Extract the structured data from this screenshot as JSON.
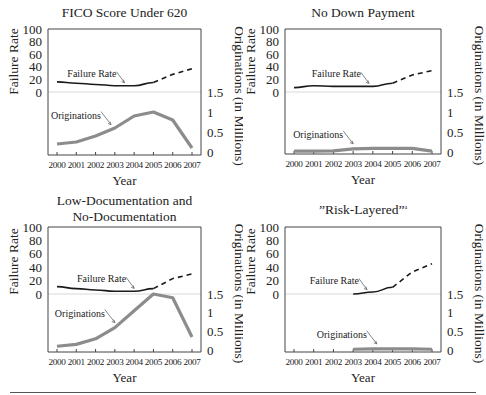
{
  "figure": {
    "shared": {
      "xlabel": "Year",
      "ylabel_left": "Failure Rate",
      "ylabel_right": "Originations (in Millions)",
      "left_ticks": [
        "100",
        "80",
        "60",
        "40",
        "20",
        "0"
      ],
      "right_ticks": [
        "1.5",
        "1",
        "0.5",
        "0"
      ],
      "series_labels": {
        "failure": "Failure Rate",
        "originations": "Originations"
      }
    },
    "colors": {
      "failure_line": "#1a1a1a",
      "originations_line": "#8c8c8c",
      "axis": "#444444",
      "zero_line": "#d8d8d8"
    }
  },
  "chart_data": [
    {
      "type": "line",
      "title": "FICO Score Under 620",
      "title_lines": [
        "FICO Score Under 620"
      ],
      "xlabel": "Year",
      "ylabel": "Failure Rate",
      "y2label": "Originations (in Millions)",
      "categories": [
        "2000",
        "2001",
        "2002",
        "2003",
        "2004",
        "2005",
        "2006",
        "2007"
      ],
      "series": [
        {
          "name": "Failure Rate",
          "axis": "left",
          "values": [
            16,
            14,
            12,
            10,
            10,
            15,
            null,
            null
          ],
          "style": "solid"
        },
        {
          "name": "Failure Rate (projected)",
          "axis": "left",
          "values": [
            null,
            null,
            null,
            null,
            null,
            15,
            28,
            37
          ],
          "style": "dashed"
        },
        {
          "name": "Originations",
          "axis": "right",
          "values": [
            0.2,
            0.25,
            0.4,
            0.6,
            0.9,
            1.0,
            0.8,
            0.1
          ],
          "style": "solid"
        }
      ],
      "ylim": [
        0,
        100
      ],
      "y2lim": [
        0,
        1.5
      ],
      "annotations": [
        {
          "text": "Failure Rate",
          "arrow_to": "2003.5"
        },
        {
          "text": "Originations",
          "arrow_to": "2002.8"
        }
      ],
      "grid": false
    },
    {
      "type": "line",
      "title": "No Down Payment",
      "title_lines": [
        "No Down Payment"
      ],
      "xlabel": "Year",
      "ylabel": "Failure Rate",
      "y2label": "Originations (in Millions)",
      "categories": [
        "2000",
        "2001",
        "2002",
        "2003",
        "2004",
        "2005",
        "2006",
        "2007"
      ],
      "series": [
        {
          "name": "Failure Rate",
          "axis": "left",
          "values": [
            7,
            10,
            9,
            9,
            9,
            14,
            null,
            null
          ],
          "style": "solid"
        },
        {
          "name": "Failure Rate (projected)",
          "axis": "left",
          "values": [
            null,
            null,
            null,
            null,
            null,
            14,
            27,
            34
          ],
          "style": "dashed"
        },
        {
          "name": "Originations",
          "axis": "right",
          "values": [
            0.02,
            0.02,
            0.03,
            0.08,
            0.09,
            0.09,
            0.09,
            0.02
          ],
          "style": "solid"
        }
      ],
      "ylim": [
        0,
        100
      ],
      "y2lim": [
        0,
        1.5
      ],
      "annotations": [
        {
          "text": "Failure Rate",
          "arrow_to": "2003.8"
        },
        {
          "text": "Originations",
          "arrow_to": "2003.0"
        }
      ],
      "grid": false
    },
    {
      "type": "line",
      "title": "Low-Documentation and No-Documentation",
      "title_lines": [
        "Low-Documentation and",
        "No-Documentation"
      ],
      "xlabel": "Year",
      "ylabel": "Failure Rate",
      "y2label": "Originations (in Millions)",
      "categories": [
        "2000",
        "2001",
        "2002",
        "2003",
        "2004",
        "2005",
        "2006",
        "2007"
      ],
      "series": [
        {
          "name": "Failure Rate",
          "axis": "left",
          "values": [
            11,
            8,
            6,
            4,
            4,
            8,
            null,
            null
          ],
          "style": "solid"
        },
        {
          "name": "Failure Rate (projected)",
          "axis": "left",
          "values": [
            null,
            null,
            null,
            null,
            null,
            8,
            23,
            30
          ],
          "style": "dashed"
        },
        {
          "name": "Originations",
          "axis": "right",
          "values": [
            0.1,
            0.15,
            0.3,
            0.6,
            1.05,
            1.5,
            1.4,
            0.35
          ],
          "style": "solid"
        }
      ],
      "ylim": [
        0,
        100
      ],
      "y2lim": [
        0,
        1.5
      ],
      "annotations": [
        {
          "text": "Failure Rate",
          "arrow_to": "2004.0"
        },
        {
          "text": "Originations",
          "arrow_to": "2003.0"
        }
      ],
      "grid": false
    },
    {
      "type": "line",
      "title": "“Risk-Layered”",
      "title_lines": [
        "”Risk-Layered”"
      ],
      "title_footnote": "a",
      "xlabel": "Year",
      "ylabel": "Failure Rate",
      "y2label": "Originations (in Millions)",
      "categories": [
        "2000",
        "2001",
        "2002",
        "2003",
        "2004",
        "2005",
        "2006",
        "2007"
      ],
      "series": [
        {
          "name": "Failure Rate",
          "axis": "left",
          "values": [
            null,
            null,
            null,
            0,
            3,
            10,
            null,
            null
          ],
          "style": "solid"
        },
        {
          "name": "Failure Rate (projected)",
          "axis": "left",
          "values": [
            null,
            null,
            null,
            null,
            null,
            10,
            33,
            45
          ],
          "style": "dashed"
        },
        {
          "name": "Originations",
          "axis": "right",
          "values": [
            null,
            null,
            null,
            0.02,
            0.03,
            0.03,
            0.03,
            0.02
          ],
          "style": "solid"
        }
      ],
      "ylim": [
        0,
        100
      ],
      "y2lim": [
        0,
        1.5
      ],
      "annotations": [
        {
          "text": "Failure Rate",
          "arrow_to": "2003.7"
        },
        {
          "text": "Originations",
          "arrow_to": "2004.2"
        }
      ],
      "grid": false
    }
  ]
}
